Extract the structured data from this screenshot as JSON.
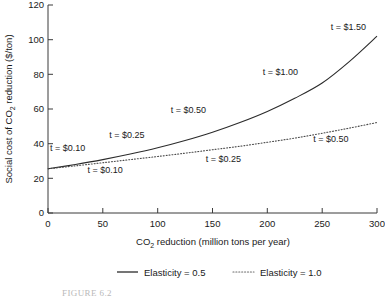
{
  "chart_data": {
    "type": "line",
    "title": "",
    "xlabel": "CO2 reduction (million tons per year)",
    "xlabel_main": "CO",
    "xlabel_sub": "2",
    "xlabel_rest": " reduction (million tons per year)",
    "ylabel": "Social cost of CO2 reduction ($/ton)",
    "ylabel_main": "Social cost of CO",
    "ylabel_sub": "2",
    "ylabel_rest": " reduction ($/ton)",
    "xlim": [
      0,
      300
    ],
    "ylim": [
      0,
      120
    ],
    "xticks": [
      "0",
      "50",
      "100",
      "150",
      "200",
      "250",
      "300"
    ],
    "xtick_values": [
      0,
      50,
      100,
      150,
      200,
      250,
      300
    ],
    "yticks": [
      "0",
      "20",
      "40",
      "60",
      "80",
      "100",
      "120"
    ],
    "ytick_values": [
      0,
      20,
      40,
      60,
      80,
      100,
      120
    ],
    "grid": false,
    "legend_position": "below-plot",
    "series": [
      {
        "name": "Elasticity = 0.5",
        "style": "solid",
        "color": "#2b2b2b",
        "x": [
          0,
          25,
          50,
          75,
          100,
          125,
          150,
          175,
          200,
          225,
          250,
          275,
          300
        ],
        "values": [
          25.5,
          28.0,
          30.8,
          34.0,
          37.6,
          41.8,
          46.6,
          52.2,
          58.6,
          66.2,
          75.0,
          87.5,
          102.0
        ]
      },
      {
        "name": "Elasticity = 1.0",
        "style": "dotted",
        "color": "#4a4a4a",
        "x": [
          0,
          25,
          50,
          75,
          100,
          125,
          150,
          175,
          200,
          225,
          250,
          275,
          300
        ],
        "values": [
          25.5,
          27.2,
          29.0,
          30.8,
          32.6,
          34.5,
          36.5,
          38.5,
          40.8,
          43.2,
          46.0,
          49.0,
          52.2
        ]
      }
    ],
    "annotations": [
      {
        "text": "t = $0.10",
        "series": "Elasticity = 0.5",
        "x": 18,
        "y": 35.5
      },
      {
        "text": "t = $0.25",
        "series": "Elasticity = 0.5",
        "x": 72,
        "y": 43.5
      },
      {
        "text": "t = $0.50",
        "series": "Elasticity = 0.5",
        "x": 128,
        "y": 57.5
      },
      {
        "text": "t = $1.00",
        "series": "Elasticity = 0.5",
        "x": 212,
        "y": 79.5
      },
      {
        "text": "t = $1.50",
        "series": "Elasticity = 0.5",
        "x": 274,
        "y": 105.5
      },
      {
        "text": "t = $0.10",
        "series": "Elasticity = 1.0",
        "x": 52,
        "y": 23.0
      },
      {
        "text": "t = $0.25",
        "series": "Elasticity = 1.0",
        "x": 160,
        "y": 29.5
      },
      {
        "text": "t = $0.50",
        "series": "Elasticity = 1.0",
        "x": 258,
        "y": 41.0
      }
    ]
  },
  "legend": {
    "items": [
      {
        "label": "Elasticity = 0.5",
        "style": "solid"
      },
      {
        "label": "Elasticity = 1.0",
        "style": "dotted"
      }
    ]
  },
  "caption": {
    "text": "FIGURE 6.2"
  }
}
